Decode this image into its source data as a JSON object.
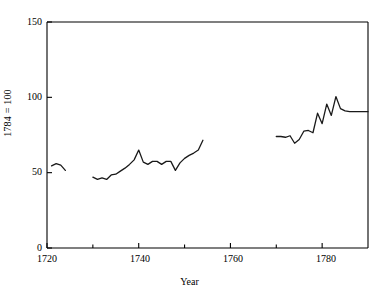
{
  "chart_data": {
    "type": "line",
    "title": "",
    "xlabel": "Year",
    "ylabel": "1784 = 100",
    "xlim": [
      1720,
      1790
    ],
    "ylim": [
      0,
      150
    ],
    "xticks": [
      1720,
      1740,
      1760,
      1780
    ],
    "xticks_minor": [
      1730,
      1750,
      1770
    ],
    "yticks": [
      0,
      50,
      100,
      150
    ],
    "grid": false,
    "legend": null,
    "series": [
      {
        "name": "segment-1",
        "x": [
          1721,
          1722,
          1723,
          1724
        ],
        "values": [
          54.5,
          56,
          55,
          51.5
        ]
      },
      {
        "name": "segment-2",
        "x": [
          1730,
          1731,
          1732,
          1733,
          1734,
          1735,
          1736,
          1737,
          1738,
          1739,
          1740,
          1741,
          1742,
          1743,
          1744,
          1745,
          1746,
          1747,
          1748,
          1749,
          1750,
          1751,
          1752,
          1753,
          1754
        ],
        "values": [
          47,
          45.5,
          46.5,
          45.5,
          48.5,
          49,
          51,
          53,
          55.5,
          58.5,
          65,
          57,
          55.5,
          57.5,
          57.5,
          55.5,
          57.5,
          57.5,
          51.5,
          56.5,
          59.5,
          61.5,
          63,
          65,
          71.5
        ]
      },
      {
        "name": "segment-3",
        "x": [
          1770,
          1771,
          1772,
          1773,
          1774,
          1775,
          1776,
          1777,
          1778,
          1779,
          1780,
          1781,
          1782,
          1783,
          1784,
          1785,
          1786,
          1787,
          1788,
          1789,
          1790
        ],
        "values": [
          74,
          74,
          73.5,
          74.5,
          69.5,
          72,
          77.5,
          78,
          76.5,
          89.5,
          82.5,
          95.5,
          88,
          100.5,
          92.5,
          91,
          90.5,
          90.5,
          90.5,
          90.5,
          90.5
        ]
      }
    ]
  },
  "axes": {
    "x_title": "Year",
    "y_title": "1784 = 100",
    "x_tick_labels": [
      "1720",
      "1740",
      "1760",
      "1780"
    ],
    "y_tick_labels": [
      "0",
      "50",
      "100",
      "150"
    ]
  },
  "style": {
    "line_color": "#1a1a1a",
    "axis_color": "#000000",
    "background": "#ffffff"
  }
}
